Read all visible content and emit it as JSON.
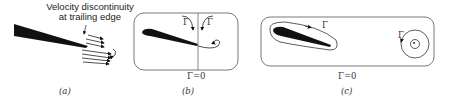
{
  "figure": {
    "panels": [
      {
        "id": "a",
        "caption": "(a)",
        "annotation_line1": "Velocity discontinuity",
        "annotation_line2": "at trailing edge"
      },
      {
        "id": "b",
        "caption": "(b)",
        "circulation_left": "Γ",
        "circulation_right": "Γ",
        "total_label": "Γ=0"
      },
      {
        "id": "c",
        "caption": "(c)",
        "circulation_airfoil": "Γ",
        "circulation_vortex": "Γ",
        "total_label": "Γ=0"
      }
    ]
  }
}
